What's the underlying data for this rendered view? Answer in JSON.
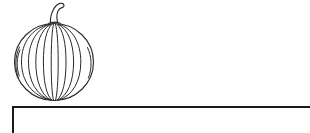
{
  "page": {
    "background_color": "#ffffff",
    "width": 310,
    "height": 133
  },
  "illustration": {
    "name": "pumpkin",
    "label": "Pumpkin line drawing",
    "style": "black-and-white outline clip art",
    "stroke_color": "#2b2b2b",
    "fill_color": "#ffffff",
    "stroke_width": 1.15,
    "rib_count": 9,
    "bounds": {
      "x": 14,
      "y": 3,
      "width": 80,
      "height": 98
    },
    "body": {
      "cx": 54,
      "cy": 62,
      "rx": 40,
      "ry": 39
    },
    "stem": {
      "x": 44,
      "y": 3,
      "width": 18,
      "height": 21,
      "shape": "curved-hook"
    }
  },
  "answer_box": {
    "name": "answer-box",
    "label": "Answer box",
    "value": "",
    "placeholder": "",
    "border_color": "#1a1a1a",
    "border_width": 2,
    "fill_color": "#ffffff",
    "x": 12,
    "y": 106,
    "clipped_edges": "right-and-bottom"
  }
}
